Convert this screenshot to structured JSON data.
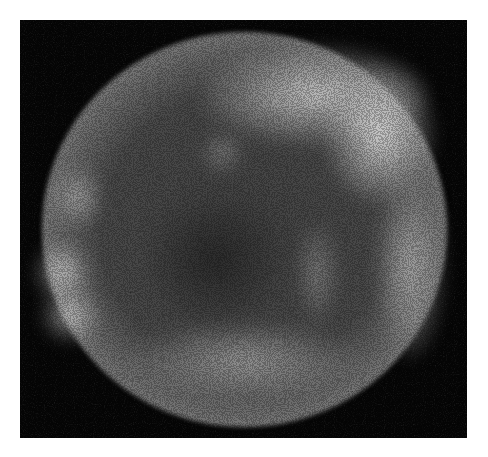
{
  "image": {
    "subject": "supernova remnant shell (X-ray, grayscale)",
    "background_color": "#ffffff",
    "frame_color": "#050505",
    "frame": {
      "x": 20,
      "y": 20,
      "width": 447,
      "height": 418
    },
    "shell": {
      "cx": 245,
      "cy": 230,
      "rx": 202,
      "ry": 198
    },
    "bright_regions": [
      {
        "name": "top-arc",
        "x": 200,
        "y": 45,
        "w": 200,
        "h": 90,
        "intensity": 0.85
      },
      {
        "name": "upper-right-rim",
        "x": 330,
        "y": 60,
        "w": 90,
        "h": 120,
        "intensity": 0.9
      },
      {
        "name": "right-rim",
        "x": 380,
        "y": 160,
        "w": 60,
        "h": 170,
        "intensity": 0.7
      },
      {
        "name": "left-lobe-upper",
        "x": 50,
        "y": 160,
        "w": 50,
        "h": 60,
        "intensity": 0.65
      },
      {
        "name": "left-lobe-mid",
        "x": 30,
        "y": 240,
        "w": 55,
        "h": 60,
        "intensity": 0.8
      },
      {
        "name": "left-lobe-lower",
        "x": 35,
        "y": 285,
        "w": 60,
        "h": 55,
        "intensity": 0.75
      },
      {
        "name": "bottom-arc",
        "x": 120,
        "y": 320,
        "w": 230,
        "h": 75,
        "intensity": 0.7
      },
      {
        "name": "interior-knot",
        "x": 200,
        "y": 130,
        "w": 40,
        "h": 40,
        "intensity": 0.5
      },
      {
        "name": "interior-filament-right",
        "x": 290,
        "y": 210,
        "w": 40,
        "h": 110,
        "intensity": 0.55
      }
    ]
  }
}
